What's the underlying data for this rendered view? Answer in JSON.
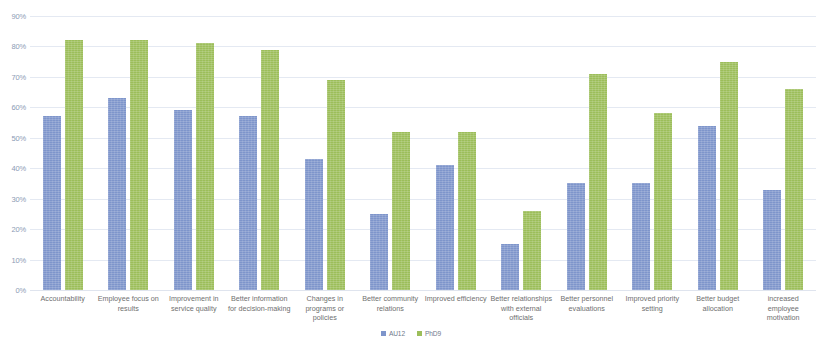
{
  "chart_data": {
    "type": "bar",
    "title": "",
    "xlabel": "",
    "ylabel": "",
    "ylim": [
      0,
      90
    ],
    "ytick_step": 10,
    "grid": true,
    "legend_position": "bottom",
    "ytick_labels": [
      "90%",
      "80%",
      "70%",
      "60%",
      "50%",
      "40%",
      "30%",
      "20%",
      "10%",
      "0%"
    ],
    "ytick_values": [
      90,
      80,
      70,
      60,
      50,
      40,
      30,
      20,
      10,
      0
    ],
    "categories": [
      "Accountability",
      "Employee focus on results",
      "Improvement in service quality",
      "Better information for decision-making",
      "Changes in programs or policies",
      "Better community relations",
      "Improved efficiency",
      "Better relationships with external officials",
      "Better personnel evaluations",
      "Improved priority setting",
      "Better budget allocation",
      "increased employee motivation"
    ],
    "series": [
      {
        "name": "AU12",
        "color": "#7e95cb",
        "values": [
          57,
          63,
          59,
          57,
          43,
          25,
          41,
          15,
          35,
          35,
          54,
          33
        ]
      },
      {
        "name": "PhD9",
        "color": "#9cbe5a",
        "values": [
          82,
          82,
          81,
          79,
          69,
          52,
          52,
          26,
          71,
          58,
          75,
          66
        ]
      }
    ]
  },
  "colors": {
    "series_a": "#7e95cb",
    "series_b": "#9cbe5a",
    "gridline": "#e4e9f2",
    "axis_text": "#8c9bb5",
    "category_text": "#6f6f6f",
    "background": "#ffffff"
  }
}
